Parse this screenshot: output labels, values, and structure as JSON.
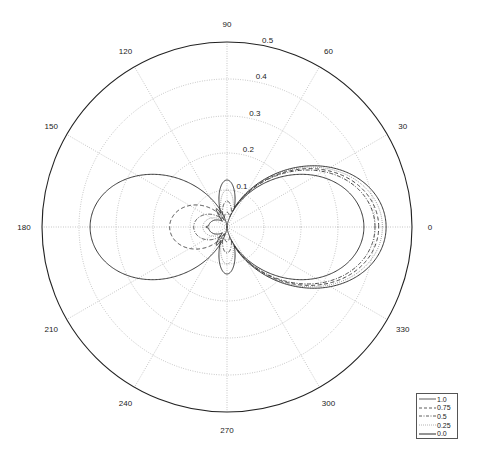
{
  "chart_data": {
    "type": "polar-line",
    "title": "",
    "angle_unit": "degrees",
    "r_max": 0.5,
    "r_ticks": [
      0.1,
      0.2,
      0.3,
      0.4,
      0.5
    ],
    "r_tick_labels": [
      "0.1",
      "0.2",
      "0.3",
      "0.4",
      "0.5"
    ],
    "theta_ticks": [
      0,
      30,
      60,
      90,
      120,
      150,
      180,
      210,
      240,
      270,
      300,
      330
    ],
    "theta_tick_labels": [
      "0",
      "30",
      "60",
      "90",
      "120",
      "150",
      "180",
      "210",
      "240",
      "270",
      "300",
      "330"
    ],
    "grid": true,
    "legend_position": "lower right",
    "legend": [
      "1.0",
      "0.75",
      "0.5",
      "0.25",
      "0.0"
    ],
    "series": [
      {
        "name": "1.0",
        "style": "solid",
        "forward_peak": 0.37,
        "backward_peak": 0.37,
        "side_lobe_peak": 0.0
      },
      {
        "name": "0.75",
        "style": "dashed",
        "forward_peak": 0.41,
        "backward_peak": 0.155,
        "side_lobe_peak": 0.04
      },
      {
        "name": "0.5",
        "style": "dashdot",
        "forward_peak": 0.4,
        "backward_peak": 0.09,
        "side_lobe_peak": 0.07
      },
      {
        "name": "0.25",
        "style": "dotted",
        "forward_peak": 0.42,
        "backward_peak": 0.065,
        "side_lobe_peak": 0.1
      },
      {
        "name": "0.0",
        "style": "solid",
        "forward_peak": 0.43,
        "backward_peak": 0.05,
        "side_lobe_peak": 0.127
      }
    ]
  },
  "legend": {
    "items": [
      {
        "label": "1.0"
      },
      {
        "label": "0.75"
      },
      {
        "label": "0.5"
      },
      {
        "label": "0.25"
      },
      {
        "label": "0.0"
      }
    ]
  }
}
